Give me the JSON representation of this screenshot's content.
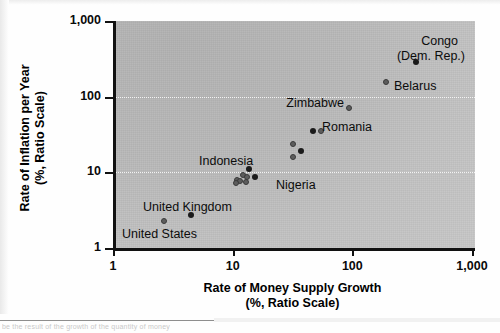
{
  "figure": {
    "background_color": "#ffffff",
    "plot_background_color": "#bdbdbd",
    "axis_color": "#111111",
    "gridline_color": "#f4f4f4",
    "point_color_dark": "#1b1b1b",
    "point_color_mid": "#5d5d5d",
    "bottom_clipped_text": "be the result of the growth of the quantity of money"
  },
  "chart_data": {
    "type": "scatter",
    "title": "",
    "xlabel": "Rate of Money Supply Growth (%, Ratio Scale)",
    "xlabel_line1": "Rate of Money Supply Growth",
    "xlabel_line2": "(%, Ratio Scale)",
    "ylabel": "Rate of Inflation per Year (%, Ratio Scale)",
    "ylabel_line1": "Rate of Inflation per Year",
    "ylabel_line2": "(%, Ratio Scale)",
    "xscale": "log",
    "yscale": "log",
    "xlim": [
      1,
      1000
    ],
    "ylim": [
      1,
      1000
    ],
    "grid": "horizontal-dotted",
    "legend": "none",
    "xticks": [
      {
        "value": 1,
        "label": "1"
      },
      {
        "value": 10,
        "label": "10"
      },
      {
        "value": 100,
        "label": "100"
      },
      {
        "value": 1000,
        "label": "1,000"
      }
    ],
    "yticks": [
      {
        "value": 1,
        "label": "1"
      },
      {
        "value": 10,
        "label": "10"
      },
      {
        "value": 100,
        "label": "100"
      },
      {
        "value": 1000,
        "label": "1,000"
      }
    ],
    "gridlines_y": [
      10,
      100
    ],
    "points": [
      {
        "name": "Congo (Dem. Rep.)",
        "x": 320,
        "y": 285,
        "style": "dark",
        "size": 6
      },
      {
        "name": "Belarus",
        "x": 182,
        "y": 155,
        "style": "mid",
        "size": 6
      },
      {
        "name": "Zimbabwe",
        "x": 89,
        "y": 70,
        "style": "mid",
        "size": 6
      },
      {
        "name": "Romania",
        "x": 44,
        "y": 35,
        "style": "dark",
        "size": 6
      },
      {
        "name": "Romania-2",
        "x": 52,
        "y": 35,
        "style": "mid",
        "size": 6
      },
      {
        "name": "Nigeria-upper",
        "x": 30,
        "y": 24,
        "style": "mid",
        "size": 6
      },
      {
        "name": "Nigeria-mid",
        "x": 35,
        "y": 19,
        "style": "dark",
        "size": 6
      },
      {
        "name": "Nigeria-lower",
        "x": 30,
        "y": 16,
        "style": "mid",
        "size": 6
      },
      {
        "name": "Indonesia-a",
        "x": 13,
        "y": 11,
        "style": "dark",
        "size": 6
      },
      {
        "name": "Indonesia-b",
        "x": 11.5,
        "y": 9.3,
        "style": "mid",
        "size": 6
      },
      {
        "name": "Indonesia-c",
        "x": 12.5,
        "y": 8.6,
        "style": "mid",
        "size": 6
      },
      {
        "name": "Indonesia-d",
        "x": 14.5,
        "y": 8.6,
        "style": "dark",
        "size": 6
      },
      {
        "name": "Indonesia-e",
        "x": 10.3,
        "y": 8.0,
        "style": "mid",
        "size": 6
      },
      {
        "name": "Indonesia-f",
        "x": 10.9,
        "y": 7.6,
        "style": "mid",
        "size": 6
      },
      {
        "name": "Indonesia-g",
        "x": 12.2,
        "y": 7.4,
        "style": "mid",
        "size": 6
      },
      {
        "name": "Indonesia-h",
        "x": 10.0,
        "y": 7.2,
        "style": "mid",
        "size": 6
      },
      {
        "name": "United Kingdom",
        "x": 4.2,
        "y": 2.7,
        "style": "dark",
        "size": 6
      },
      {
        "name": "United States",
        "x": 2.5,
        "y": 2.3,
        "style": "mid",
        "size": 6
      }
    ],
    "annotations": [
      {
        "text": "Congo",
        "x_px": 455,
        "y_px": 34,
        "align": "right"
      },
      {
        "text": "(Dem. Rep.)",
        "x_px": 462,
        "y_px": 49,
        "align": "right"
      },
      {
        "text": "Belarus",
        "x_px": 391,
        "y_px": 79,
        "align": "left"
      },
      {
        "text": "Zimbabwe",
        "x_px": 341,
        "y_px": 96,
        "align": "right"
      },
      {
        "text": "Romania",
        "x_px": 319,
        "y_px": 120,
        "align": "left"
      },
      {
        "text": "Nigeria",
        "x_px": 273,
        "y_px": 178,
        "align": "left"
      },
      {
        "text": "Indonesia",
        "x_px": 196,
        "y_px": 154,
        "align": "left"
      },
      {
        "text": "United Kingdom",
        "x_px": 140,
        "y_px": 200,
        "align": "left"
      },
      {
        "text": "United States",
        "x_px": 119,
        "y_px": 227,
        "align": "left"
      }
    ]
  }
}
